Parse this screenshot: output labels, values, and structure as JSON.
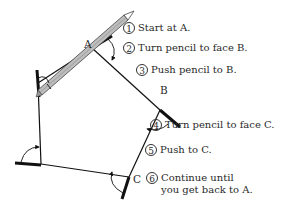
{
  "figure": {
    "type": "diagram"
  },
  "vertices": {
    "A": "A",
    "B": "B",
    "C": "C"
  },
  "steps": [
    {
      "num": "1",
      "text": "Start at A."
    },
    {
      "num": "2",
      "text": "Turn pencil to face B."
    },
    {
      "num": "3",
      "text": "Push pencil to B."
    },
    {
      "num": "4",
      "text": "Turn pencil to face C."
    },
    {
      "num": "5",
      "text": "Push to C."
    },
    {
      "num": "6",
      "text": "Continue until\nyou get back to A."
    }
  ],
  "colors": {
    "line": "#111111",
    "pencil_body": "#bdbdbd",
    "pencil_edge": "#444444",
    "text": "#2a2a2a"
  }
}
